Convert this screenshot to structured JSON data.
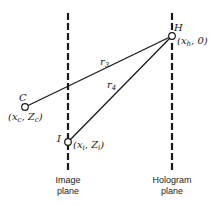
{
  "diagram": {
    "points": {
      "H": {
        "label": "H",
        "coords": "(x",
        "sub": "h",
        "rest": ", 0)"
      },
      "C": {
        "label": "C",
        "coords": "(x",
        "sub": "c",
        "mid": ", Z",
        "sub2": "c",
        "end": ")"
      },
      "I": {
        "label": "I",
        "coords": "(x",
        "sub": "i",
        "mid": ", Z",
        "sub2": "i",
        "end": ")"
      }
    },
    "distances": {
      "r3": {
        "base": "r",
        "sub": "3"
      },
      "r4": {
        "base": "r",
        "sub": "4"
      }
    },
    "planes": {
      "image": {
        "line1": "Image",
        "line2": "plane"
      },
      "hologram": {
        "line1": "Hologram",
        "line2": "plane"
      }
    },
    "colors": {
      "line": "#1a1a1a",
      "background": "#ffffff"
    }
  }
}
